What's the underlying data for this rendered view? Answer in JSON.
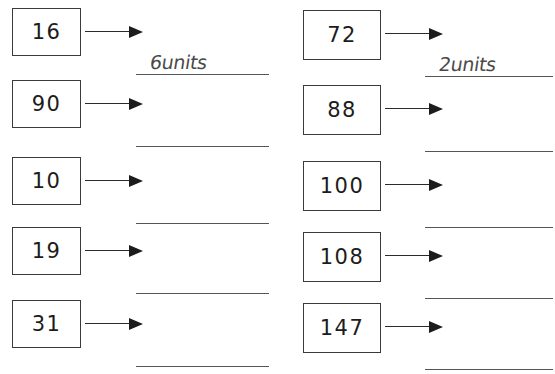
{
  "worksheet": {
    "title": "Units conversion worksheet",
    "columns": [
      {
        "name": "left-column",
        "rows": [
          {
            "number": "16",
            "answer": "6units",
            "arrow": "arrow-right-icon",
            "has_answer": true
          },
          {
            "number": "90",
            "answer": "",
            "arrow": "arrow-right-icon",
            "has_answer": false
          },
          {
            "number": "10",
            "answer": "",
            "arrow": "arrow-right-icon",
            "has_answer": false
          },
          {
            "number": "19",
            "answer": "",
            "arrow": "arrow-right-icon",
            "has_answer": false
          },
          {
            "number": "31",
            "answer": "",
            "arrow": "arrow-right-icon",
            "has_answer": false
          }
        ]
      },
      {
        "name": "right-column",
        "rows": [
          {
            "number": "72",
            "answer": "2units",
            "arrow": "arrow-right-icon",
            "has_answer": true
          },
          {
            "number": "88",
            "answer": "",
            "arrow": "arrow-right-icon",
            "has_answer": false
          },
          {
            "number": "100",
            "answer": "",
            "arrow": "arrow-right-icon",
            "has_answer": false
          },
          {
            "number": "108",
            "answer": "",
            "arrow": "arrow-right-icon",
            "has_answer": false
          },
          {
            "number": "147",
            "answer": "",
            "arrow": "arrow-right-icon",
            "has_answer": false
          }
        ]
      }
    ]
  },
  "layout": {
    "left_row_tops": [
      7,
      79,
      156,
      226,
      299
    ],
    "right_row_tops": [
      9,
      84,
      160,
      231,
      302
    ],
    "ink_color": "#1c1c1c",
    "rule_color": "#555555",
    "handwriting_color": "#4a4a4a",
    "background": "#ffffff"
  }
}
